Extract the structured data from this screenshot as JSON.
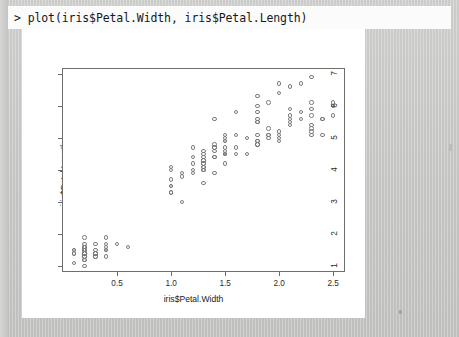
{
  "console": {
    "prompt_line": "> plot(iris$Petal.Width, iris$Petal.Length)"
  },
  "colors": {
    "desktop": "#c6c6c4",
    "page": "#ffffff",
    "axis": "#6e6e6e",
    "point_stroke": "#7c7c7c",
    "text": "#222222"
  },
  "chart_data": {
    "type": "scatter",
    "title": "",
    "xlabel": "iris$Petal.Width",
    "ylabel": "iris$Petal.Length",
    "xlim": [
      0.0,
      2.6
    ],
    "ylim": [
      0.85,
      7.15
    ],
    "xticks": [
      0.5,
      1.0,
      1.5,
      2.0,
      2.5
    ],
    "xticklabels": [
      "0.5",
      "1.0",
      "1.5",
      "2.0",
      "2.5"
    ],
    "yticks": [
      1,
      2,
      3,
      4,
      5,
      6,
      7
    ],
    "yticklabels": [
      "1",
      "2",
      "3",
      "4",
      "5",
      "6",
      "7"
    ],
    "grid": false,
    "legend": false,
    "marker": "open-circle",
    "n_points": 150,
    "series": [
      {
        "name": "iris",
        "x": [
          0.2,
          0.2,
          0.2,
          0.2,
          0.2,
          0.4,
          0.3,
          0.2,
          0.2,
          0.1,
          0.2,
          0.2,
          0.1,
          0.1,
          0.2,
          0.4,
          0.4,
          0.3,
          0.3,
          0.3,
          0.2,
          0.4,
          0.2,
          0.5,
          0.2,
          0.2,
          0.4,
          0.2,
          0.2,
          0.2,
          0.2,
          0.4,
          0.1,
          0.2,
          0.2,
          0.2,
          0.2,
          0.1,
          0.2,
          0.2,
          0.3,
          0.3,
          0.2,
          0.6,
          0.4,
          0.3,
          0.2,
          0.2,
          0.2,
          0.2,
          1.4,
          1.5,
          1.5,
          1.3,
          1.5,
          1.3,
          1.6,
          1.0,
          1.3,
          1.4,
          1.0,
          1.5,
          1.0,
          1.4,
          1.3,
          1.4,
          1.5,
          1.0,
          1.5,
          1.1,
          1.8,
          1.3,
          1.5,
          1.2,
          1.3,
          1.4,
          1.4,
          1.7,
          1.5,
          1.0,
          1.1,
          1.0,
          1.2,
          1.6,
          1.5,
          1.6,
          1.5,
          1.3,
          1.3,
          1.3,
          1.2,
          1.4,
          1.2,
          1.0,
          1.3,
          1.2,
          1.3,
          1.3,
          1.1,
          1.3,
          2.5,
          1.9,
          2.1,
          1.8,
          2.2,
          2.1,
          1.7,
          1.8,
          1.8,
          2.5,
          2.0,
          1.9,
          2.1,
          2.0,
          2.4,
          2.3,
          1.8,
          2.2,
          2.3,
          1.5,
          2.3,
          2.0,
          2.0,
          1.8,
          2.1,
          1.8,
          1.8,
          1.8,
          2.1,
          1.6,
          1.9,
          2.0,
          2.2,
          1.5,
          1.4,
          2.3,
          2.4,
          1.8,
          1.8,
          2.1,
          2.4,
          2.3,
          1.9,
          2.3,
          2.5,
          2.3,
          1.9,
          2.0,
          2.3,
          1.8
        ],
        "y": [
          1.4,
          1.4,
          1.3,
          1.5,
          1.4,
          1.7,
          1.4,
          1.5,
          1.4,
          1.5,
          1.5,
          1.6,
          1.4,
          1.1,
          1.2,
          1.5,
          1.3,
          1.4,
          1.7,
          1.5,
          1.7,
          1.5,
          1.0,
          1.7,
          1.9,
          1.6,
          1.6,
          1.5,
          1.4,
          1.6,
          1.6,
          1.5,
          1.5,
          1.4,
          1.5,
          1.2,
          1.3,
          1.4,
          1.3,
          1.5,
          1.3,
          1.3,
          1.3,
          1.6,
          1.9,
          1.4,
          1.6,
          1.4,
          1.5,
          1.4,
          4.7,
          4.5,
          4.9,
          4.0,
          4.6,
          4.5,
          4.7,
          3.3,
          4.6,
          3.9,
          3.5,
          4.2,
          4.0,
          4.7,
          3.6,
          4.4,
          4.5,
          4.1,
          4.5,
          3.9,
          4.8,
          4.0,
          4.9,
          4.7,
          4.3,
          4.4,
          4.8,
          5.0,
          4.5,
          3.5,
          3.8,
          3.7,
          3.9,
          5.1,
          4.5,
          4.5,
          4.7,
          4.4,
          4.1,
          4.0,
          4.4,
          4.6,
          4.0,
          3.3,
          4.2,
          4.2,
          4.2,
          4.3,
          3.0,
          4.1,
          6.0,
          5.1,
          5.9,
          5.6,
          5.8,
          6.6,
          4.5,
          6.3,
          5.8,
          6.1,
          5.1,
          5.3,
          5.5,
          5.0,
          5.1,
          5.3,
          5.5,
          6.7,
          6.9,
          5.0,
          5.7,
          4.9,
          6.7,
          4.9,
          5.7,
          6.0,
          4.8,
          4.9,
          5.6,
          5.8,
          6.1,
          6.4,
          5.6,
          5.1,
          5.6,
          6.1,
          5.6,
          5.5,
          4.8,
          5.4,
          5.6,
          5.1,
          5.1,
          5.9,
          5.7,
          5.2,
          5.0,
          5.2,
          5.4,
          5.1
        ]
      }
    ]
  }
}
